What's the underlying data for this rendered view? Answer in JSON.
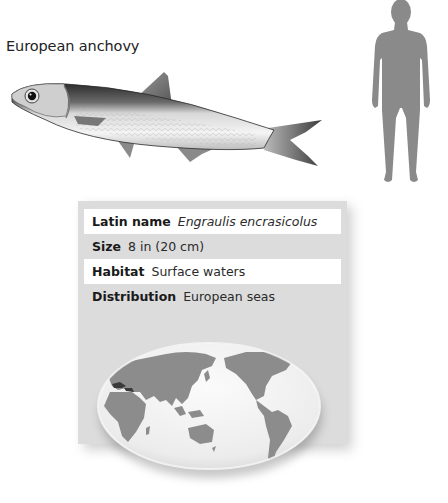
{
  "species": {
    "common_name": "European anchovy"
  },
  "illustrations": {
    "fish": "european-anchovy-illustration",
    "human": "human-scale-silhouette",
    "map": "world-distribution-map"
  },
  "facts": {
    "rows": [
      {
        "label": "Latin name",
        "value": "Engraulis encrasicolus",
        "italic": true,
        "bg": "#ffffff"
      },
      {
        "label": "Size",
        "value": "8 in (20 cm)",
        "italic": false,
        "bg": "#dcdcdc"
      },
      {
        "label": "Habitat",
        "value": "Surface waters",
        "italic": false,
        "bg": "#ffffff"
      },
      {
        "label": "Distribution",
        "value": "European seas",
        "italic": false,
        "bg": "#dcdcdc"
      }
    ]
  },
  "colors": {
    "card_gray": "#dcdcdc",
    "land_gray": "#8c8c8c",
    "silhouette_gray": "#8a8a8a",
    "map_ocean": "#f2f2f2",
    "distribution_highlight": "#3a3a3a"
  }
}
